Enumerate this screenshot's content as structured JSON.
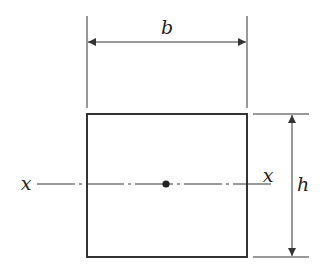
{
  "diagram": {
    "labels": {
      "width": "b",
      "height": "h",
      "axis_left": "x",
      "axis_right": "x"
    },
    "colors": {
      "stroke": "#333333",
      "background": "#ffffff"
    }
  }
}
